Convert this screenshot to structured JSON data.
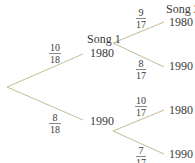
{
  "diagram": {
    "type": "probability-tree",
    "level_headers": {
      "song1": "Song 1",
      "song2": "Song 2"
    },
    "first_level": [
      {
        "outcome": "1980",
        "probability": {
          "numerator": "10",
          "denominator": "18"
        }
      },
      {
        "outcome": "1990",
        "probability": {
          "numerator": "8",
          "denominator": "18"
        }
      }
    ],
    "second_level": {
      "after_1980": [
        {
          "outcome": "1980",
          "probability": {
            "numerator": "9",
            "denominator": "17"
          }
        },
        {
          "outcome": "1990",
          "probability": {
            "numerator": "8",
            "denominator": "17"
          }
        }
      ],
      "after_1990": [
        {
          "outcome": "1980",
          "probability": {
            "numerator": "10",
            "denominator": "17"
          }
        },
        {
          "outcome": "1990",
          "probability": {
            "numerator": "7",
            "denominator": "17"
          }
        }
      ]
    },
    "line_color": "#c2bd96"
  }
}
